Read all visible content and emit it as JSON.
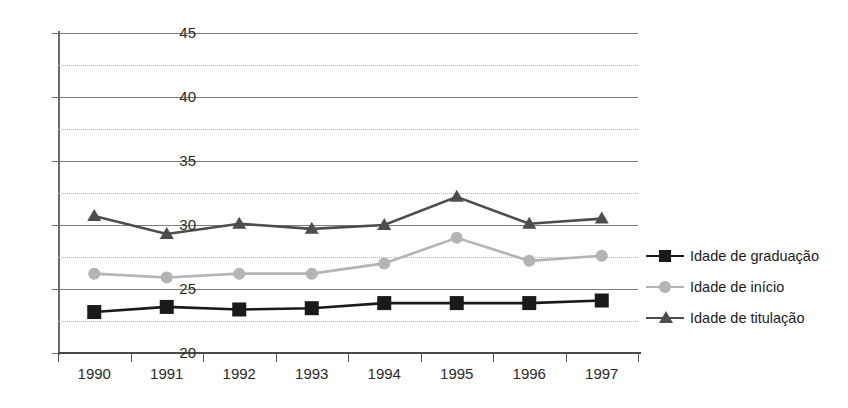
{
  "chart_data": {
    "type": "line",
    "title": "",
    "xlabel": "",
    "ylabel": "",
    "categories": [
      "1990",
      "1991",
      "1992",
      "1993",
      "1994",
      "1995",
      "1996",
      "1997"
    ],
    "ylim": [
      20,
      45
    ],
    "y_major_ticks": [
      20,
      25,
      30,
      35,
      40,
      45
    ],
    "y_minor_gridlines": [
      22.5,
      27.5,
      32.5,
      37.5,
      42.5
    ],
    "grid": "horizontal major solid plus minor dotted",
    "legend_position": "right",
    "series": [
      {
        "name": "Idade de graduação",
        "marker": "square",
        "color": "#1a1a1a",
        "values": [
          23.2,
          23.6,
          23.4,
          23.5,
          23.9,
          23.9,
          23.9,
          24.1
        ]
      },
      {
        "name": "Idade  de início",
        "marker": "circle",
        "color": "#b4b4b4",
        "values": [
          26.2,
          25.9,
          26.2,
          26.2,
          27.0,
          29.0,
          27.2,
          27.6
        ]
      },
      {
        "name": "Idade  de titulação",
        "marker": "triangle",
        "color": "#4d4d4d",
        "values": [
          30.7,
          29.3,
          30.1,
          29.7,
          30.0,
          32.2,
          30.1,
          30.5
        ]
      }
    ]
  },
  "legend": {
    "items": [
      {
        "label": "Idade de graduação",
        "color": "#1a1a1a",
        "marker": "square"
      },
      {
        "label": "Idade  de início",
        "color": "#b4b4b4",
        "marker": "circle"
      },
      {
        "label": "Idade  de titulação",
        "color": "#4d4d4d",
        "marker": "triangle"
      }
    ]
  },
  "axis": {
    "y_labels": [
      "45",
      "40",
      "35",
      "30",
      "25",
      "20"
    ],
    "x_labels": [
      "1990",
      "1991",
      "1992",
      "1993",
      "1994",
      "1995",
      "1996",
      "1997"
    ]
  }
}
